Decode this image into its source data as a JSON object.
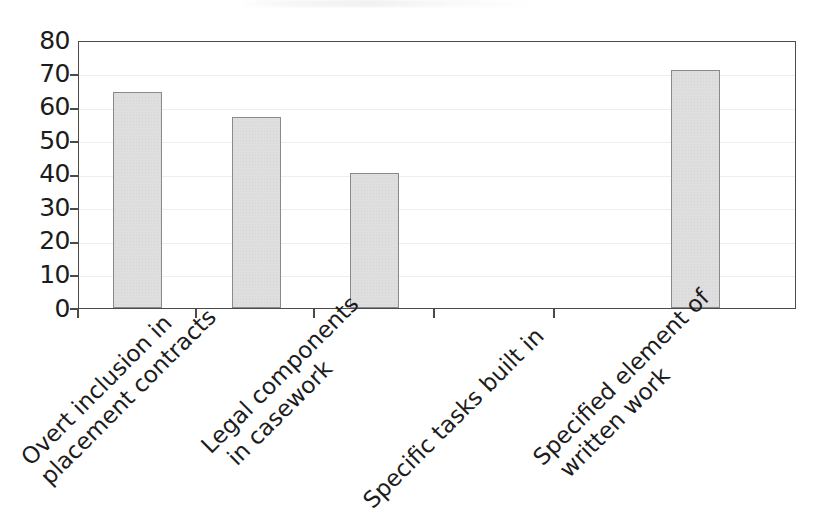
{
  "chart_data": {
    "type": "bar",
    "title": "",
    "subtitle": "",
    "xlabel": "",
    "ylabel": "",
    "ylim": [
      0,
      80
    ],
    "ytick_step": 10,
    "yticks": [
      "80",
      "70",
      "60",
      "50",
      "40",
      "30",
      "20",
      "10",
      "0"
    ],
    "grid": true,
    "legend": "none",
    "categories": [
      "Overt inclusion in placement contracts",
      "Legal components in casework",
      "Specific tasks built in",
      "Specified element of written work"
    ],
    "category_label_lines": [
      [
        "Overt inclusion in",
        "placement contracts"
      ],
      [
        "Legal components",
        "in casework"
      ],
      [
        "Specific tasks built in"
      ],
      [
        "Specified element of",
        "written work"
      ]
    ],
    "values": [
      65,
      57.5,
      40.5,
      71.5
    ],
    "bar_fill_color": "#dedede",
    "bar_border_color": "#8a8a8a",
    "axis_color": "#4a4a4a",
    "gridline_color": "#eeeeee",
    "background_color": "#ffffff",
    "text_color": "#1c1c1c"
  }
}
